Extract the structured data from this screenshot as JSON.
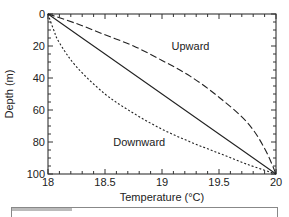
{
  "chart_data": {
    "type": "line",
    "title": "",
    "xlabel": "Temperature (°C)",
    "ylabel": "Depth (m)",
    "xlim": [
      18,
      20
    ],
    "ylim": [
      0,
      100
    ],
    "y_inverted": true,
    "grid": false,
    "legend": null,
    "x_ticks": [
      18,
      18.5,
      19,
      19.5,
      20
    ],
    "x_tick_labels": [
      "18",
      "18.5",
      "19",
      "19.5",
      "20"
    ],
    "y_ticks": [
      0,
      20,
      40,
      60,
      80,
      100
    ],
    "y_tick_labels": [
      "0",
      "20",
      "40",
      "60",
      "80",
      "100"
    ],
    "series": [
      {
        "name": "No flow (linear)",
        "style": "solid",
        "x": [
          18.0,
          18.5,
          19.0,
          19.5,
          20.0
        ],
        "y": [
          0,
          25,
          50,
          75,
          100
        ]
      },
      {
        "name": "Upward",
        "style": "dashed",
        "x": [
          18.0,
          18.25,
          18.5,
          18.75,
          19.0,
          19.25,
          19.5,
          19.75,
          19.9,
          20.0
        ],
        "y": [
          0,
          6,
          13,
          20,
          29,
          39,
          52,
          68,
          84,
          100
        ]
      },
      {
        "name": "Downward",
        "style": "dotted",
        "x": [
          18.0,
          18.05,
          18.1,
          18.25,
          18.5,
          18.75,
          19.0,
          19.25,
          19.5,
          19.75,
          20.0
        ],
        "y": [
          0,
          10,
          18,
          33,
          50,
          62,
          72,
          80,
          87,
          94,
          100
        ]
      }
    ],
    "annotations": [
      {
        "text": "Upward",
        "x": 19.25,
        "y": 20
      },
      {
        "text": "Downward",
        "x": 18.8,
        "y": 80
      }
    ]
  }
}
